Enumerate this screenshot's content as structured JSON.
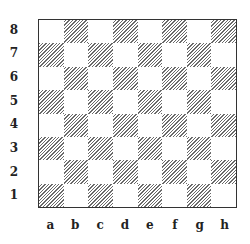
{
  "diagram": {
    "type": "chessboard",
    "ranks": [
      "8",
      "7",
      "6",
      "5",
      "4",
      "3",
      "2",
      "1"
    ],
    "files": [
      "a",
      "b",
      "c",
      "d",
      "e",
      "f",
      "g",
      "h"
    ],
    "square_colors": {
      "light": "#ffffff",
      "dark_hatch": "#6a6a6a"
    },
    "pieces": []
  }
}
